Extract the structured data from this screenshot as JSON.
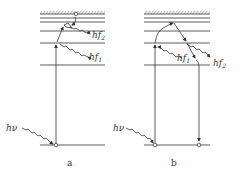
{
  "diagram": {
    "panels": [
      {
        "id": "a",
        "caption": "a",
        "excitation_label": "hν",
        "emission_labels": [
          "hf",
          "hf"
        ],
        "emission_subscripts": [
          "1",
          "2"
        ]
      },
      {
        "id": "b",
        "caption": "b",
        "excitation_label": "hν",
        "emission_labels": [
          "hf",
          "hf"
        ],
        "emission_subscripts": [
          "1",
          "2"
        ]
      }
    ],
    "colors": {
      "line": "#333333",
      "background": "#ffffff"
    }
  }
}
